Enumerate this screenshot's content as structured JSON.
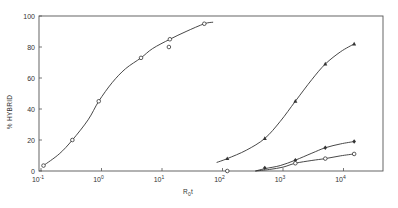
{
  "chart_data": {
    "type": "scatter",
    "title": "",
    "xlabel": "R0t",
    "ylabel": "% HYBRID",
    "xscale": "log",
    "xlim": [
      0.1,
      30000
    ],
    "ylim": [
      0,
      100
    ],
    "grid": false,
    "legend": null,
    "x_ticks": [
      {
        "value": 0.1,
        "label": "10",
        "exp": "-1"
      },
      {
        "value": 1,
        "label": "10",
        "exp": "0"
      },
      {
        "value": 10,
        "label": "10",
        "exp": "1"
      },
      {
        "value": 100,
        "label": "10",
        "exp": "2"
      },
      {
        "value": 1000,
        "label": "10",
        "exp": "3"
      },
      {
        "value": 10000,
        "label": "10",
        "exp": "4"
      }
    ],
    "y_ticks": [
      0,
      20,
      40,
      60,
      80,
      100
    ],
    "series": [
      {
        "name": "open-circles-fast",
        "marker": "open-circle",
        "x": [
          0.11,
          0.33,
          0.9,
          4.5,
          13,
          13.5,
          50
        ],
        "y": [
          3.5,
          20,
          45,
          73,
          80,
          85,
          95
        ],
        "curve_x": [
          0.11,
          0.2,
          0.33,
          0.6,
          0.9,
          1.5,
          2.5,
          4.5,
          7,
          13.5,
          25,
          50,
          70
        ],
        "curve_y": [
          3.5,
          11,
          20,
          33,
          45,
          57,
          66,
          73,
          79,
          85,
          90,
          95,
          96
        ]
      },
      {
        "name": "filled-triangles",
        "marker": "filled-triangle",
        "x": [
          120,
          500,
          1600,
          5000,
          15000
        ],
        "y": [
          8,
          21,
          45,
          69,
          82
        ],
        "curve_x": [
          80,
          120,
          250,
          500,
          900,
          1600,
          3000,
          5000,
          9000,
          15000
        ],
        "curve_y": [
          5.5,
          8,
          13.5,
          21,
          32,
          45,
          59,
          69,
          77,
          82
        ]
      },
      {
        "name": "filled-diamonds",
        "marker": "filled-diamond",
        "x": [
          500,
          1600,
          5000,
          15000
        ],
        "y": [
          2,
          7,
          15,
          19
        ],
        "curve_x": [
          350,
          500,
          900,
          1600,
          3000,
          5000,
          9000,
          15000
        ],
        "curve_y": [
          0,
          1.5,
          3.5,
          7,
          11.5,
          15,
          17.5,
          19
        ]
      },
      {
        "name": "open-circles-slow",
        "marker": "open-circle",
        "x": [
          120,
          1600,
          5000,
          15000
        ],
        "y": [
          0,
          5,
          8,
          11
        ],
        "curve_x": [
          350,
          600,
          1000,
          1600,
          3000,
          5000,
          9000,
          15000
        ],
        "curve_y": [
          0,
          1,
          2.5,
          5,
          6.8,
          8,
          9.8,
          11
        ]
      }
    ]
  },
  "axes": {
    "y_label": "% HYBRID",
    "x_label_main": "R",
    "x_label_sub": "0",
    "x_label_tail": "t"
  },
  "style": {
    "line_color": "#333333",
    "frame_color": "#555555",
    "background": "#ffffff"
  }
}
